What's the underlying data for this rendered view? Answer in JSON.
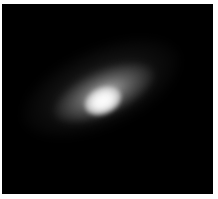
{
  "image": {
    "subject": "galaxy",
    "description": "Grayscale astronomical image of an inclined galaxy with a bright central core on a black background",
    "colors": {
      "background": "#000000",
      "border": "#ffffff",
      "core": "#ffffff"
    }
  }
}
